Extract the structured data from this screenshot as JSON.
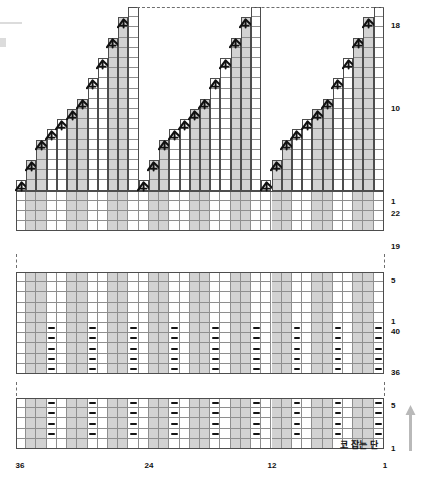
{
  "document": {
    "kind": "knitting-chart",
    "title": "",
    "language": "ko"
  },
  "annotations": {
    "cast_on_label": "코 잡는 단",
    "direction_arrow": "up-arrow-icon"
  },
  "axes": {
    "column_label_positions": [
      36,
      24,
      12,
      1
    ],
    "column_labels": [
      "36",
      "24",
      "12",
      "1"
    ],
    "column_count": 36,
    "read_direction": "right-to-left"
  },
  "panels": [
    {
      "id": "top-shaping-panel",
      "name": "shaping-chart",
      "row_labels": [
        {
          "text": "18",
          "row": 18
        },
        {
          "text": "10",
          "row": 10
        },
        {
          "text": "1",
          "row": 1
        },
        {
          "text": "22",
          "row": 22
        },
        {
          "text": "19",
          "row": 19
        }
      ],
      "row_range_upper": [
        1,
        18
      ],
      "row_range_lower": [
        19,
        22
      ],
      "motif_repeats": 3,
      "symbol": "left-leaning-decrease",
      "symbol_count_per_motif": 12
    },
    {
      "id": "middle-rib-panel",
      "name": "rib-chart-middle",
      "row_labels": [
        {
          "text": "5",
          "row": 5
        },
        {
          "text": "1",
          "row": 1
        },
        {
          "text": "40",
          "row": 40
        },
        {
          "text": "36",
          "row": 36
        }
      ],
      "row_range_upper": [
        1,
        5
      ],
      "row_range_lower": [
        36,
        40
      ],
      "symbol": "purl-dash"
    },
    {
      "id": "bottom-rib-panel",
      "name": "rib-chart-bottom",
      "row_labels": [
        {
          "text": "5",
          "row": 5
        },
        {
          "text": "1",
          "row": 1
        }
      ],
      "row_range": [
        1,
        5
      ],
      "symbol": "purl-dash",
      "cast_on_row_text": "코 잡는 단"
    }
  ],
  "legend": {
    "decrease_symbol_name": "left-leaning-decrease-icon",
    "purl_symbol_name": "purl-dash-icon",
    "shaded_column_name": "knit-column-shaded",
    "white_column_name": "purl-column-white"
  },
  "chart_data": {
    "type": "heatmap",
    "title": "",
    "xlabel": "",
    "ylabel": "",
    "grid": true,
    "legend_position": "none",
    "columns": 36,
    "column_ticks": [
      36,
      24,
      12,
      1
    ],
    "shaded_column_pattern": "groups of knit columns shaded grey alternating with white purl columns, 4-stitch repeat",
    "sections": [
      {
        "name": "shaping-chart",
        "rows": 22,
        "row_tick_labels": [
          "18",
          "10",
          "1",
          "22",
          "19"
        ],
        "repeats": 3,
        "decreases_per_repeat": 12,
        "note": "staircase bind-off/decrease shaping, 3 identical motifs"
      },
      {
        "name": "rib-chart-middle",
        "rows": 10,
        "row_tick_labels": [
          "5",
          "1",
          "40",
          "36"
        ],
        "purl_rows": 5,
        "plain_rows": 5
      },
      {
        "name": "rib-chart-bottom",
        "rows": 5,
        "row_tick_labels": [
          "5",
          "1"
        ],
        "purl_rows": 4,
        "cast_on_row": 1
      }
    ]
  }
}
